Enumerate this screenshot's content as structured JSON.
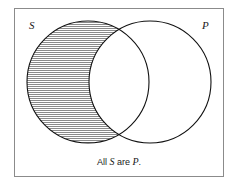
{
  "figure": {
    "type": "venn-diagram",
    "frame": {
      "border_color": "#8b8b8b",
      "background_color": "#ffffff",
      "x": 14,
      "y": 8,
      "width": 210,
      "height": 169
    },
    "circles": [
      {
        "id": "subject",
        "label": "S",
        "cx": 88,
        "cy": 82,
        "r": 61,
        "stroke_color": "#111111",
        "fill_color": "#ffffff"
      },
      {
        "id": "predicate",
        "label": "P",
        "cx": 150,
        "cy": 82,
        "r": 61,
        "stroke_color": "#111111",
        "fill_color": "#ffffff"
      }
    ],
    "shading": {
      "region": "S-minus-P",
      "style": "horizontal-hatch",
      "line_color": "#8a8a8a",
      "line_spacing_px": 2,
      "meaning": "empty region"
    },
    "labels": {
      "subject": "S",
      "predicate": "P"
    },
    "caption": {
      "lead": "All ",
      "subject": "S",
      "mid": " are ",
      "predicate": "P",
      "tail": "."
    }
  }
}
